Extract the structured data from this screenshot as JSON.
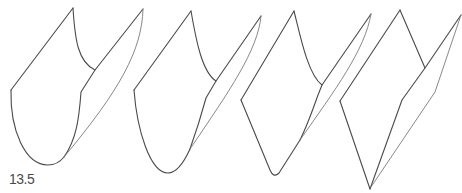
{
  "figure": {
    "label": "13.5",
    "stroke_color": "#4a4a4a",
    "background": "#ffffff",
    "shapes": [
      {
        "name": "shape-1",
        "type": "rounded-fold"
      },
      {
        "name": "shape-2",
        "type": "rounded-fold"
      },
      {
        "name": "shape-3",
        "type": "semi-sharp-fold"
      },
      {
        "name": "shape-4",
        "type": "sharp-diamond-fold"
      }
    ]
  }
}
